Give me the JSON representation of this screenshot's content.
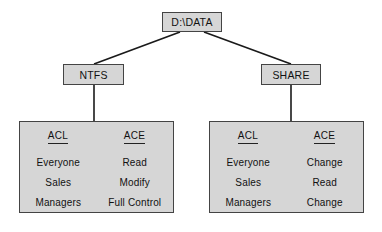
{
  "diagram": {
    "root": {
      "label": "D:\\DATA"
    },
    "branches": [
      {
        "key": "ntfs",
        "label": "NTFS"
      },
      {
        "key": "share",
        "label": "SHARE"
      }
    ],
    "columns": {
      "acl": "ACL",
      "ace": "ACE"
    },
    "panels": {
      "ntfs": {
        "acl": [
          "Everyone",
          "Sales",
          "Managers"
        ],
        "ace": [
          "Read",
          "Modify",
          "Full Control"
        ]
      },
      "share": {
        "acl": [
          "Everyone",
          "Sales",
          "Managers"
        ],
        "ace": [
          "Change",
          "Read",
          "Change"
        ]
      }
    },
    "colors": {
      "box_fill": "#d6d6d6",
      "box_border": "#444444",
      "line": "#1a1a1a",
      "text": "#111111",
      "background": "#ffffff"
    }
  }
}
